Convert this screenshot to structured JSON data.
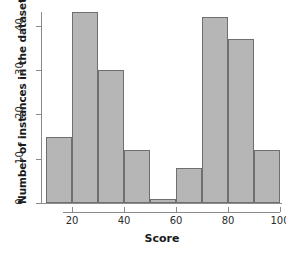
{
  "chart_data": {
    "type": "bar",
    "title": "",
    "subtitle": "",
    "xlabel": "Score",
    "ylabel": "Number of instances in the dataset",
    "categories": [
      "10-20",
      "20-30",
      "30-40",
      "40-50",
      "50-60",
      "60-70",
      "70-80",
      "80-90",
      "90-100"
    ],
    "bin_edges": [
      10,
      20,
      30,
      40,
      50,
      60,
      70,
      80,
      90,
      100
    ],
    "bin_width": 10,
    "values": [
      15,
      43,
      30,
      12,
      1,
      8,
      42,
      37,
      12
    ],
    "xlim": [
      10,
      100
    ],
    "ylim": [
      0,
      44
    ],
    "xticks": [
      20,
      40,
      60,
      80,
      100
    ],
    "yticks": [
      0,
      10,
      20,
      30,
      40
    ],
    "xtick_labels": [
      "20",
      "40",
      "60",
      "80",
      "100"
    ],
    "ytick_labels": [
      "0",
      "10",
      "20",
      "30",
      "40"
    ],
    "grid": false,
    "legend": false,
    "legend_position": "none",
    "bar_fill_color": "#b6b6b6",
    "bar_border_color": "#6f6f6f",
    "axis_color": "#8a8a8a",
    "text_color": "#1a1a1a",
    "background_color": "#ffffff"
  }
}
